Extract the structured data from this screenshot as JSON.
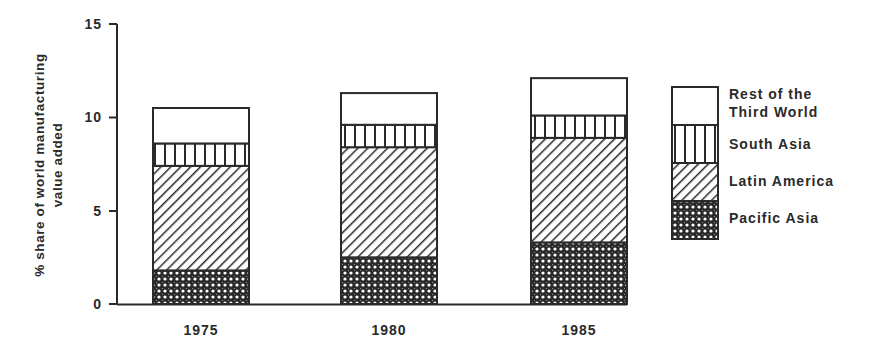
{
  "chart_data": {
    "type": "bar",
    "stacked": true,
    "title": "",
    "xlabel": "",
    "ylabel": "% share of world manufacturing value added",
    "ylabel_lines": [
      "% share of world manufacturing",
      "value added"
    ],
    "ylim": [
      0,
      15
    ],
    "yticks": [
      "0",
      "5",
      "10",
      "15"
    ],
    "categories": [
      "1975",
      "1980",
      "1985"
    ],
    "series": [
      {
        "name": "Pacific Asia",
        "pattern": "crosshatch",
        "values": [
          1.8,
          2.5,
          3.3
        ]
      },
      {
        "name": "Latin America",
        "pattern": "diagonal",
        "values": [
          5.6,
          5.9,
          5.6
        ]
      },
      {
        "name": "South Asia",
        "pattern": "vertical",
        "values": [
          1.2,
          1.2,
          1.2
        ]
      },
      {
        "name": "Rest of the Third World",
        "pattern": "blank",
        "values": [
          1.9,
          1.7,
          2.0
        ]
      }
    ],
    "totals": [
      10.5,
      11.3,
      12.1
    ],
    "grid": false,
    "legend_position": "right"
  },
  "legend": {
    "items": [
      {
        "lines": [
          "Rest of the",
          "Third World"
        ]
      },
      {
        "lines": [
          "South Asia"
        ]
      },
      {
        "lines": [
          "Latin America"
        ]
      },
      {
        "lines": [
          "Pacific Asia"
        ]
      }
    ]
  },
  "colors": {
    "ink": "#2a2a2a",
    "background": "#ffffff"
  }
}
